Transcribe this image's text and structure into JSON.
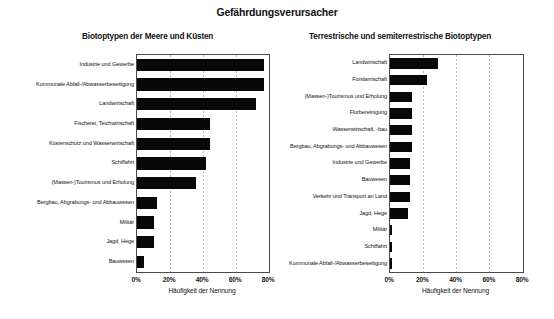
{
  "chart_data": [
    {
      "type": "bar",
      "orientation": "horizontal",
      "id": "biotoptypen-meere-kuesten",
      "title": "Gefährdungsverursacher",
      "subtitle": "Biotoptypen der Meere und Küsten",
      "xlabel": "Häufigkeit der Nennung",
      "ylabel": "",
      "xlim": [
        0,
        80
      ],
      "xticks": [
        0,
        20,
        40,
        60,
        80
      ],
      "xticklabels": [
        "0%",
        "20%",
        "40%",
        "60%",
        "80%"
      ],
      "grid": true,
      "legend": "none",
      "categories": [
        "Industrie und Gewerbe",
        "Kommunale Abfall-/Abwasserbeseitigung",
        "Landwirtschaft",
        "Fischerei, Teichwirtschaft",
        "Küstenschutz und Wasserwirtschaft",
        "Schiffahrt",
        "(Massen-)Tourismus und Erholung",
        "Bergbau, Abgrabungs- und Abbauwesen",
        "Militär",
        "Jagd, Hege",
        "Bauwesen"
      ],
      "values": [
        77,
        77,
        72,
        44,
        44,
        42,
        36,
        12,
        10,
        10,
        4
      ]
    },
    {
      "type": "bar",
      "orientation": "horizontal",
      "id": "terrestrische-semiterrestrische-biotoptypen",
      "title": "Gefährdungsverursacher",
      "subtitle": "Terrestrische und semiterrestrische Biotoptypen",
      "xlabel": "Häufigkeit der Nennung",
      "ylabel": "",
      "xlim": [
        0,
        80
      ],
      "xticks": [
        0,
        20,
        40,
        60,
        80
      ],
      "xticklabels": [
        "0%",
        "20%",
        "40%",
        "60%",
        "80%"
      ],
      "grid": true,
      "legend": "none",
      "categories": [
        "Landwirtschaft",
        "Forstwirtschaft",
        "(Massen-)Tourismus und Erholung",
        "Flurbereinigung",
        "Wasserwirtschaft, -bau",
        "Bergbau, Abgrabungs- und Abbauwesen",
        "Industrie und Gewerbe",
        "Bauwesen",
        "Verkehr und Transport an Land",
        "Jagd, Hege",
        "Militär",
        "Schiffahrt",
        "Kommunale Abfall-/Abwasserbeseitigung"
      ],
      "values": [
        29,
        22,
        13,
        13,
        13,
        13,
        12,
        12,
        12,
        11,
        1,
        1,
        1
      ]
    }
  ],
  "figure": {
    "title": "Gefährdungsverursacher"
  },
  "colors": {
    "bar": "#080808",
    "axis": "#4a4a4a",
    "grid": "#b9b9b9",
    "text": "#141414",
    "background": "#ffffff"
  }
}
